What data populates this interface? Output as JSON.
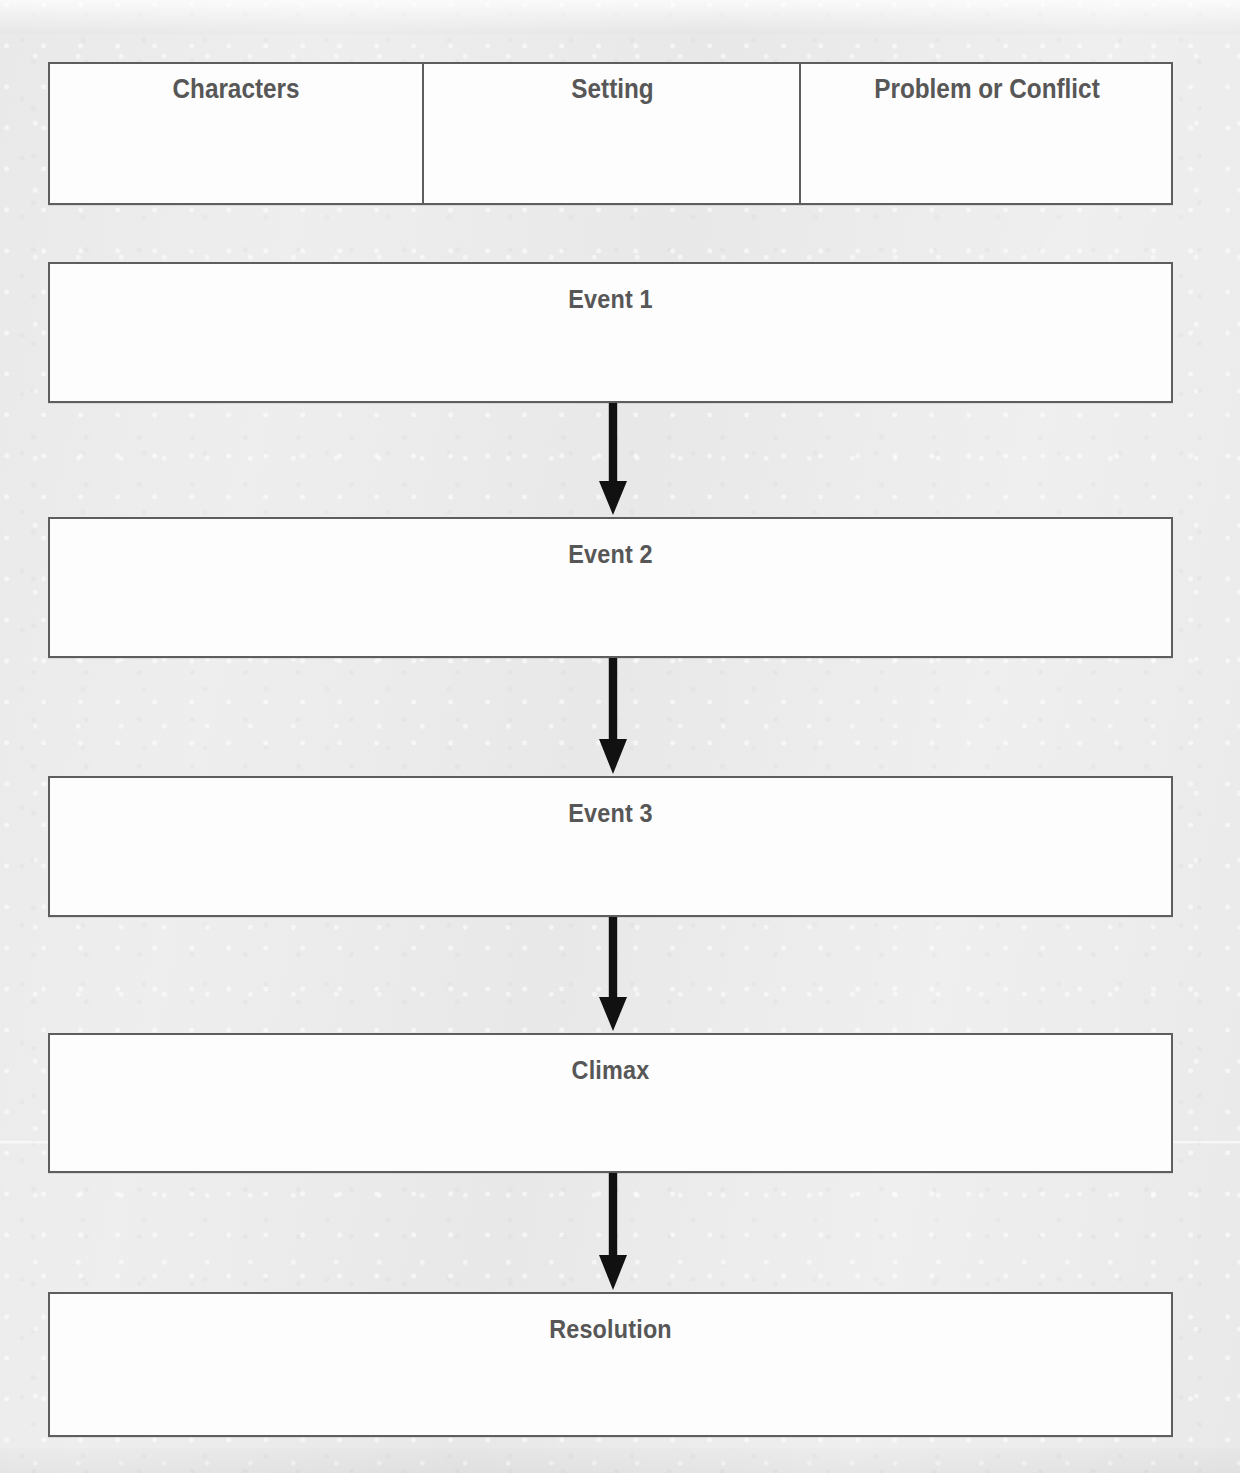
{
  "document": {
    "type": "story-map-graphic-organizer",
    "background_color": "#ebebeb",
    "box_fill_color": "#fdfdfd",
    "border_color": "#5e5e5e",
    "text_color": "#575757",
    "arrow_color": "#111111"
  },
  "header_row": {
    "cells": [
      {
        "label": "Characters"
      },
      {
        "label": "Setting"
      },
      {
        "label": "Problem or Conflict"
      }
    ]
  },
  "sequence": {
    "boxes": [
      {
        "label": "Event 1"
      },
      {
        "label": "Event 2"
      },
      {
        "label": "Event 3"
      },
      {
        "label": "Climax"
      },
      {
        "label": "Resolution"
      }
    ],
    "connectors": [
      {
        "from": "Event 1",
        "to": "Event 2",
        "direction": "down"
      },
      {
        "from": "Event 2",
        "to": "Event 3",
        "direction": "down"
      },
      {
        "from": "Event 3",
        "to": "Climax",
        "direction": "down"
      },
      {
        "from": "Climax",
        "to": "Resolution",
        "direction": "down"
      }
    ]
  }
}
